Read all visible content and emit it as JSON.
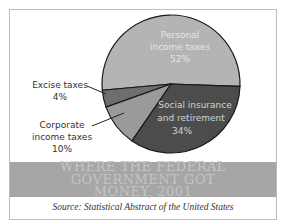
{
  "chart_data": {
    "type": "pie",
    "title": "Where the Federal Government Got Money, 2001",
    "source": "Source: Statistical Abstract of the United States",
    "slices": [
      {
        "label_lines": [
          "Personal",
          "income taxes"
        ],
        "value_label": "52%",
        "value": 52,
        "color": "#b4b4b4",
        "label_color": "#e6e6e6"
      },
      {
        "label_lines": [
          "Social insurance",
          "and retirement"
        ],
        "value_label": "34%",
        "value": 34,
        "color": "#4c4c4c",
        "label_color": "#d2d2d2"
      },
      {
        "label_lines": [
          "Corporate",
          "income taxes"
        ],
        "value_label": "10%",
        "value": 10,
        "color": "#9a9a9a",
        "label_color": "#333333"
      },
      {
        "label_lines": [
          "Excise taxes"
        ],
        "value_label": "4%",
        "value": 4,
        "color": "#6e6e6e",
        "label_color": "#333333"
      }
    ]
  },
  "banner": {
    "line1": "WHERE THE FEDERAL",
    "line2": "GOVERNMENT GOT",
    "line3": "MONEY, 2001"
  }
}
